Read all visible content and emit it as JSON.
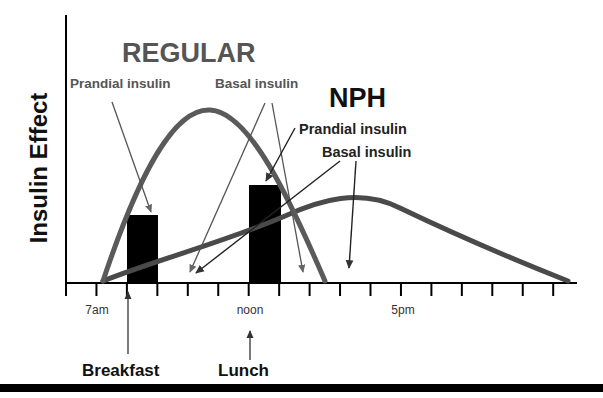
{
  "chart_data": {
    "type": "line",
    "title": "",
    "ylabel": "Insulin Effect",
    "xlabel": "",
    "x_tick_labels": [
      {
        "tick_index": 1,
        "label": "7am"
      },
      {
        "tick_index": 6,
        "label": "noon"
      },
      {
        "tick_index": 11,
        "label": "5pm"
      }
    ],
    "x_ticks_count": 17,
    "x_range_hours": [
      6,
      22
    ],
    "y_range": [
      0,
      100
    ],
    "grid": false,
    "series": [
      {
        "name": "REGULAR",
        "color": "#5a5a5a",
        "description": "Fast, high peak insulin effect",
        "points": [
          [
            7.0,
            0
          ],
          [
            8.0,
            40
          ],
          [
            9.0,
            78
          ],
          [
            10.0,
            87
          ],
          [
            11.0,
            74
          ],
          [
            12.0,
            48
          ],
          [
            13.0,
            20
          ],
          [
            13.7,
            0
          ]
        ]
      },
      {
        "name": "NPH",
        "color": "#4a4a4a",
        "description": "Slower, broad, long-lasting insulin effect",
        "points": [
          [
            7.0,
            0
          ],
          [
            9.0,
            12
          ],
          [
            11.0,
            24
          ],
          [
            13.0,
            35
          ],
          [
            14.5,
            38
          ],
          [
            16.0,
            36
          ],
          [
            18.0,
            23
          ],
          [
            20.0,
            9
          ],
          [
            21.5,
            0
          ]
        ]
      }
    ],
    "bars": [
      {
        "name": "Breakfast prandial",
        "x_start_hour": 8.0,
        "x_end_hour": 9.0,
        "value": 33,
        "color": "#000000"
      },
      {
        "name": "Lunch prandial",
        "x_start_hour": 12.0,
        "x_end_hour": 13.0,
        "value": 48,
        "color": "#000000"
      }
    ],
    "annotations": [
      {
        "text": "REGULAR",
        "group": "regular"
      },
      {
        "text": "Prandial insulin",
        "group": "regular"
      },
      {
        "text": "Basal insulin",
        "group": "regular"
      },
      {
        "text": "NPH",
        "group": "nph"
      },
      {
        "text": "Prandial insulin",
        "group": "nph"
      },
      {
        "text": "Basal insulin",
        "group": "nph"
      },
      {
        "text": "Breakfast",
        "group": "meal"
      },
      {
        "text": "Lunch",
        "group": "meal"
      }
    ]
  },
  "labels": {
    "ylabel": "Insulin Effect",
    "regular_title": "REGULAR",
    "regular_prandial": "Prandial insulin",
    "regular_basal": "Basal insulin",
    "nph_title": "NPH",
    "nph_prandial": "Prandial insulin",
    "nph_basal": "Basal insulin",
    "tick_7am": "7am",
    "tick_noon": "noon",
    "tick_5pm": "5pm",
    "breakfast": "Breakfast",
    "lunch": "Lunch"
  },
  "colors": {
    "curve_regular": "#5a5a5a",
    "curve_nph": "#4a4a4a",
    "bar": "#000000",
    "axis": "#000000",
    "arrow": "#333333",
    "footer_rule": "#000000"
  }
}
